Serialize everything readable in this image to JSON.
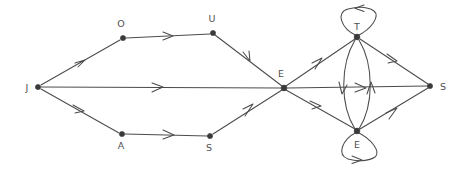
{
  "diagram": {
    "background_color": "#ffffff",
    "edge_color": "#4c4c4c",
    "node_color": "#3a3a3a",
    "label_color": "#50504f",
    "nodes": [
      {
        "id": "J",
        "label": "J",
        "x": 38,
        "y": 87,
        "label_x": 27,
        "label_y": 91,
        "label_anchor": "middle"
      },
      {
        "id": "O",
        "label": "O",
        "x": 123,
        "y": 38,
        "label_x": 121,
        "label_y": 27,
        "label_anchor": "middle"
      },
      {
        "id": "U",
        "label": "U",
        "x": 213,
        "y": 33,
        "label_x": 212,
        "label_y": 22,
        "label_anchor": "middle"
      },
      {
        "id": "A",
        "label": "A",
        "x": 122,
        "y": 134,
        "label_x": 121,
        "label_y": 149,
        "label_anchor": "middle"
      },
      {
        "id": "S1",
        "label": "S",
        "x": 210,
        "y": 136,
        "label_x": 209,
        "label_y": 151,
        "label_anchor": "middle"
      },
      {
        "id": "E1",
        "label": "E",
        "x": 284,
        "y": 88,
        "label_x": 281,
        "label_y": 77,
        "label_anchor": "middle"
      },
      {
        "id": "T",
        "label": "T",
        "x": 357,
        "y": 37,
        "label_x": 357,
        "label_y": 30,
        "label_anchor": "middle"
      },
      {
        "id": "E2",
        "label": "E",
        "x": 357,
        "y": 131,
        "label_x": 357,
        "label_y": 148,
        "label_anchor": "middle"
      },
      {
        "id": "S2",
        "label": "S",
        "x": 430,
        "y": 86,
        "label_x": 443,
        "label_y": 90,
        "label_anchor": "middle"
      }
    ],
    "edges": [
      {
        "from": "J",
        "to": "O",
        "type": "straight",
        "directed": true
      },
      {
        "from": "O",
        "to": "U",
        "type": "straight",
        "directed": true
      },
      {
        "from": "U",
        "to": "E1",
        "type": "straight",
        "directed": true
      },
      {
        "from": "J",
        "to": "E1",
        "type": "straight",
        "directed": true
      },
      {
        "from": "J",
        "to": "A",
        "type": "straight",
        "directed": true
      },
      {
        "from": "A",
        "to": "S1",
        "type": "straight",
        "directed": true
      },
      {
        "from": "S1",
        "to": "E1",
        "type": "straight",
        "directed": true
      },
      {
        "from": "E1",
        "to": "T",
        "type": "straight",
        "directed": true
      },
      {
        "from": "E1",
        "to": "S2",
        "type": "straight",
        "directed": true
      },
      {
        "from": "E1",
        "to": "E2",
        "type": "straight",
        "directed": true
      },
      {
        "from": "T",
        "to": "E2",
        "type": "curve-left",
        "directed": true
      },
      {
        "from": "E2",
        "to": "T",
        "type": "curve-right",
        "directed": true
      },
      {
        "from": "T",
        "to": "S2",
        "type": "straight",
        "directed": true
      },
      {
        "from": "E2",
        "to": "S2",
        "type": "straight",
        "directed": true
      }
    ],
    "self_loops": [
      {
        "node": "T",
        "label": "T",
        "direction": "up",
        "arrow_direction": "left"
      },
      {
        "node": "E2",
        "label": "E",
        "direction": "down",
        "arrow_direction": "right"
      }
    ]
  }
}
